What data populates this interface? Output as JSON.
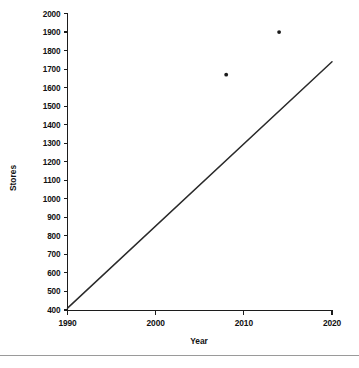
{
  "chart_data": {
    "type": "line",
    "title": "",
    "xlabel": "Year",
    "ylabel": "Stores",
    "xlim": [
      1990,
      2020
    ],
    "ylim": [
      400,
      2000
    ],
    "grid": false,
    "legend": "none",
    "x_ticks": [
      1990,
      2000,
      2010,
      2020
    ],
    "x_tick_labels": [
      "1990",
      "2000",
      "2010",
      "2020"
    ],
    "y_ticks": [
      400,
      500,
      600,
      700,
      800,
      900,
      1000,
      1100,
      1200,
      1300,
      1400,
      1500,
      1600,
      1700,
      1800,
      1900,
      2000
    ],
    "y_tick_labels": [
      "400",
      "500",
      "600",
      "700",
      "800",
      "900",
      "1000",
      "1100",
      "1200",
      "1300",
      "1400",
      "1500",
      "1600",
      "1700",
      "1800",
      "1900",
      "2000"
    ],
    "series": [
      {
        "name": "trend-line",
        "type": "line",
        "x": [
          1990,
          2020
        ],
        "values": [
          410,
          1740
        ]
      },
      {
        "name": "observed-points",
        "type": "scatter",
        "x": [
          2008,
          2014
        ],
        "values": [
          1670,
          1900
        ]
      }
    ]
  },
  "axes": {
    "y_axis_title": "Stores",
    "x_axis_title": "Year"
  },
  "figure": {
    "background_color": "#ffffff",
    "line_color": "#2a2a2a",
    "point_color": "#1a1a1a",
    "axis_color": "#1c1c1c",
    "rule_color": "#9a9a9a"
  }
}
